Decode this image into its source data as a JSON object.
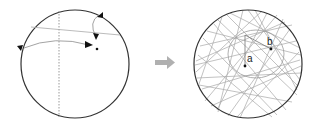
{
  "figure": {
    "left_panel": {
      "description": "Circle with dashed vertical line, curved trajectories and arrowheads converging near a point",
      "circle": {
        "cx": 75,
        "cy": 64,
        "r": 54
      },
      "dashed_line_x": 59
    },
    "transition_arrow": {
      "icon": "right-arrow-icon",
      "color": "#b0b0b0"
    },
    "right_panel": {
      "description": "Circle filled with many chords forming an inner caustic, with points a and b",
      "circle": {
        "cx": 248,
        "cy": 64,
        "r": 54
      },
      "points": [
        {
          "label": "a",
          "x": 245,
          "y": 66
        },
        {
          "label": "b",
          "x": 271,
          "y": 49
        }
      ]
    },
    "colors": {
      "outline": "#333333",
      "chords": "#a8a8a8",
      "arrow": "#b0b0b0"
    }
  }
}
